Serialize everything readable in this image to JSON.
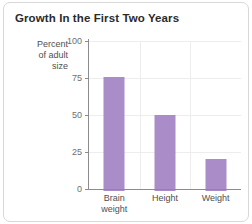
{
  "card": {
    "border_color": "#d8d8d8",
    "background": "#ffffff"
  },
  "chart_data": {
    "type": "bar",
    "title": "Growth In the First Two Years",
    "xlabel": "",
    "ylabel": "Percent\nof adult\nsize",
    "categories": [
      "Brain\nweight",
      "Height",
      "Weight"
    ],
    "values": [
      76,
      50,
      20
    ],
    "ylim": [
      0,
      100
    ],
    "yticks": [
      0,
      25,
      50,
      75,
      100
    ],
    "ytick_labels": [
      "0",
      "25",
      "50",
      "75",
      "100"
    ],
    "grid": true,
    "legend": false,
    "bar_color": "#a98cc8",
    "gridline_color": "#ededed",
    "axis_color": "#8c8c8c"
  }
}
